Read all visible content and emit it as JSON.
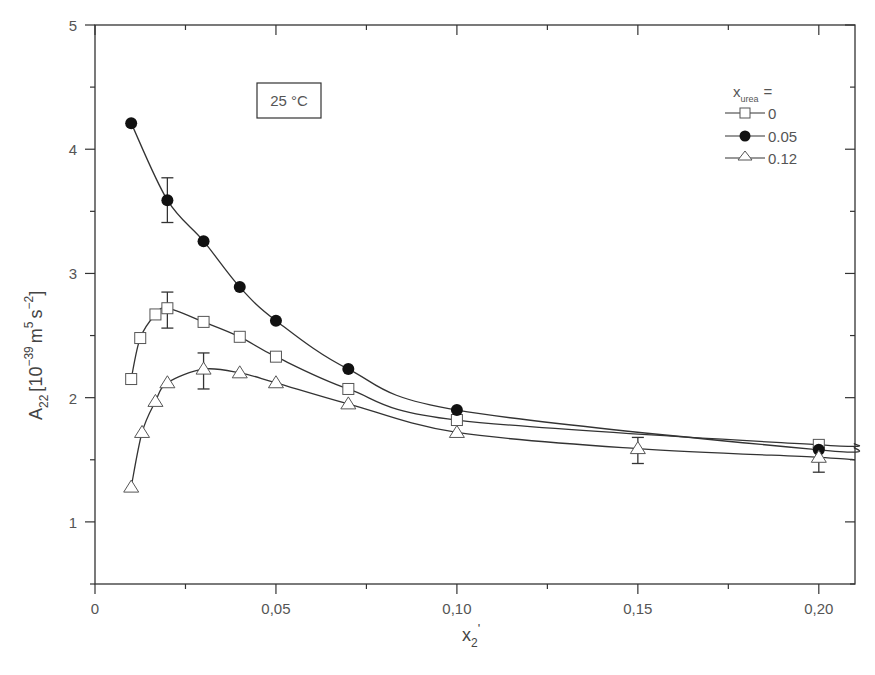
{
  "chart_data": {
    "type": "scatter",
    "title": "",
    "annotation": "25 °C",
    "xlabel": "x2'",
    "xlabel_main": "x",
    "xlabel_sub": "2",
    "xlabel_suffix": "'",
    "ylabel": "A22 [10^-39 m^5 s^-2]",
    "ylabel_parts": {
      "main": "A",
      "sub": "22",
      "open": "[10",
      "exp1": "−39",
      "m": "m",
      "exp2": "5",
      "s": "s",
      "exp3": "−2",
      "close": "]"
    },
    "xlim": [
      0,
      0.21
    ],
    "ylim": [
      0.5,
      5
    ],
    "x_ticks": [
      0,
      0.05,
      0.1,
      0.15,
      0.2
    ],
    "x_tick_labels": [
      "0",
      "0,05",
      "0,10",
      "0,15",
      "0,20"
    ],
    "y_ticks": [
      1,
      2,
      3,
      4,
      5
    ],
    "y_tick_labels": [
      "1",
      "2",
      "3",
      "4",
      "5"
    ],
    "grid": false,
    "legend": {
      "title_main": "x",
      "title_sub": "urea",
      "title_suffix": "=",
      "position": "upper right",
      "entries": [
        "0",
        "0.05",
        "0.12"
      ]
    },
    "series": [
      {
        "name": "0",
        "marker": "open-square",
        "x": [
          0.01,
          0.0125,
          0.0167,
          0.02,
          0.03,
          0.04,
          0.05,
          0.07,
          0.1,
          0.2
        ],
        "y": [
          2.15,
          2.48,
          2.67,
          2.72,
          2.61,
          2.49,
          2.33,
          2.07,
          1.82,
          1.62
        ],
        "error_bars": [
          {
            "x": 0.02,
            "low": 2.56,
            "high": 2.85
          }
        ],
        "fit_end": [
          0.21,
          1.63
        ]
      },
      {
        "name": "0.05",
        "marker": "filled-circle",
        "x": [
          0.01,
          0.02,
          0.03,
          0.04,
          0.05,
          0.07,
          0.1,
          0.2
        ],
        "y": [
          4.21,
          3.59,
          3.26,
          2.89,
          2.62,
          2.23,
          1.9,
          1.58
        ],
        "error_bars": [
          {
            "x": 0.02,
            "low": 3.41,
            "high": 3.77
          }
        ],
        "fit_end": [
          0.21,
          1.6
        ]
      },
      {
        "name": "0.12",
        "marker": "open-triangle",
        "x": [
          0.01,
          0.013,
          0.0167,
          0.02,
          0.03,
          0.04,
          0.05,
          0.07,
          0.1,
          0.15,
          0.2
        ],
        "y": [
          1.28,
          1.72,
          1.97,
          2.12,
          2.23,
          2.2,
          2.12,
          1.95,
          1.72,
          1.59,
          1.52
        ],
        "error_bars": [
          {
            "x": 0.03,
            "low": 2.07,
            "high": 2.36
          },
          {
            "x": 0.15,
            "low": 1.47,
            "high": 1.68
          },
          {
            "x": 0.2,
            "low": 1.4,
            "high": 1.6
          }
        ],
        "fit_end": [
          0.21,
          1.5
        ]
      }
    ]
  }
}
